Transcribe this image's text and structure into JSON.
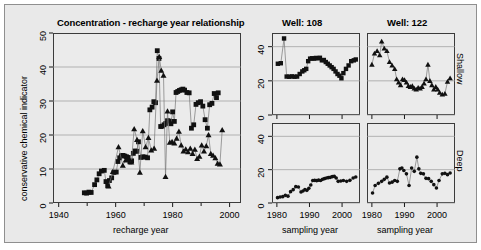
{
  "figure": {
    "background_color": "#e9e9e9",
    "panel_color": "#ebebeb",
    "marker_color": "#111111",
    "line_color": "#777777",
    "grid_color": "#9a9a9a"
  },
  "main_panel": {
    "title": "Concentration - recharge year relationship",
    "xlabel": "recharge year",
    "ylabel": "conservative chemical indicator",
    "xticks": [
      "1940",
      "1960",
      "1980",
      "2000"
    ],
    "yticks": [
      "0",
      "10",
      "20",
      "30",
      "40",
      "50"
    ]
  },
  "column_titles": [
    "Well: 108",
    "Well: 122"
  ],
  "row_titles": [
    "Shallow",
    "Deep"
  ],
  "small_panels": {
    "xlabel": "sampling year",
    "xticks": [
      "1980",
      "1990",
      "2000"
    ],
    "yticks": [
      "0",
      "20",
      "40"
    ]
  },
  "chart_data": [
    {
      "id": "main",
      "type": "scatter",
      "title": "Concentration - recharge year relationship",
      "xlabel": "recharge year",
      "ylabel": "conservative chemical indicator",
      "xlim": [
        1938,
        2004
      ],
      "ylim": [
        0,
        50
      ],
      "xticks": [
        1940,
        1960,
        1980,
        2000
      ],
      "yticks": [
        0,
        10,
        20,
        30,
        40,
        50
      ],
      "grid": true,
      "legend": null,
      "series": [
        {
          "name": "Well: 108",
          "marker": "square",
          "connected": true,
          "x": [
            1949.0,
            1949.8,
            1950.6,
            1951.4,
            1952.6,
            1953.4,
            1954.2,
            1955.0,
            1956.0,
            1956.6,
            1957.2,
            1957.8,
            1958.6,
            1959.4,
            1960.2,
            1960.8,
            1961.4,
            1962.0,
            1962.6,
            1963.2,
            1963.8,
            1964.4,
            1965.0,
            1965.6,
            1966.2,
            1966.8,
            1967.4,
            1968.0,
            1968.8,
            1969.6,
            1970.4,
            1971.2,
            1972.0,
            1972.8,
            1973.4,
            1974.0,
            1974.6,
            1975.2,
            1975.8,
            1976.4,
            1977.0,
            1977.6,
            1978.2,
            1978.8,
            1979.4,
            1980.0,
            1980.6,
            1981.2,
            1981.8,
            1982.4,
            1983.0,
            1983.6,
            1984.2,
            1985.0,
            1985.8,
            1986.6,
            1987.4,
            1988.2,
            1989.0,
            1989.8,
            1990.6,
            1991.4,
            1992.2,
            1993.0,
            1993.8,
            1994.6,
            1995.4,
            1996.0
          ],
          "y": [
            3.0,
            2.9,
            3.2,
            3.1,
            5.4,
            6.8,
            8.6,
            9.4,
            9.6,
            6.3,
            5.1,
            6.6,
            7.4,
            9.0,
            9.1,
            12.2,
            13.3,
            13.9,
            14.0,
            13.8,
            13.6,
            13.4,
            12.1,
            12.4,
            14.6,
            15.3,
            15.2,
            18.0,
            13.4,
            13.6,
            13.5,
            13.3,
            27.4,
            28.2,
            29.8,
            29.5,
            44.8,
            42.5,
            22.5,
            22.6,
            23.0,
            23.4,
            24.2,
            24.1,
            23.3,
            26.8,
            24.0,
            32.5,
            32.8,
            33.1,
            33.3,
            33.5,
            33.2,
            32.5,
            32.4,
            22.0,
            23.0,
            29.0,
            29.5,
            29.8,
            28.5,
            24.5,
            22.0,
            28.9,
            29.3,
            32.2,
            31.0,
            32.4
          ]
        },
        {
          "name": "Well: 122",
          "marker": "triangle",
          "connected": true,
          "x": [
            1957.5,
            1959.0,
            1961.0,
            1962.5,
            1963.5,
            1964.5,
            1965.5,
            1966.5,
            1967.5,
            1968.5,
            1969.5,
            1970.5,
            1971.5,
            1972.5,
            1973.5,
            1974.5,
            1975.3,
            1976.0,
            1976.8,
            1977.5,
            1978.2,
            1979.0,
            1979.8,
            1980.6,
            1981.4,
            1982.2,
            1983.0,
            1983.8,
            1984.6,
            1985.4,
            1986.2,
            1987.0,
            1987.8,
            1988.6,
            1989.4,
            1990.2,
            1991.0,
            1991.8,
            1992.6,
            1993.4,
            1994.2,
            1995.0,
            1995.8,
            1996.6,
            1997.4
          ],
          "y": [
            4.9,
            9.2,
            16.5,
            11.0,
            12.6,
            13.0,
            12.0,
            21.8,
            18.6,
            9.0,
            21.2,
            16.5,
            19.2,
            15.5,
            16.0,
            36.0,
            43.0,
            39.0,
            37.5,
            7.7,
            27.0,
            17.8,
            18.0,
            17.6,
            19.0,
            21.0,
            17.0,
            15.2,
            15.8,
            15.0,
            16.0,
            14.5,
            15.7,
            13.0,
            13.7,
            17.0,
            15.2,
            16.8,
            20.0,
            14.5,
            14.0,
            13.2,
            11.6,
            11.4,
            21.5
          ]
        }
      ]
    },
    {
      "id": "well108-shallow",
      "type": "scatter",
      "title": "Well: 108",
      "row": "Shallow",
      "xlabel": "sampling year",
      "ylabel": "",
      "xlim": [
        1978.5,
        2005.5
      ],
      "ylim": [
        0,
        48
      ],
      "xticks": [
        1980,
        1990,
        2000
      ],
      "yticks": [
        0,
        20,
        40
      ],
      "grid": true,
      "marker": "square",
      "connected": true,
      "x": [
        1980.3,
        1981.2,
        1982.2,
        1983.0,
        1983.8,
        1984.6,
        1985.4,
        1986.2,
        1987.0,
        1987.8,
        1988.4,
        1989.0,
        1989.6,
        1990.2,
        1990.8,
        1991.4,
        1992.0,
        1992.6,
        1993.2,
        1993.8,
        1994.4,
        1995.0,
        1995.6,
        1996.2,
        1996.8,
        1997.4,
        1998.0,
        1998.6,
        1999.2,
        1999.8,
        2000.4,
        2001.2,
        2002.0,
        2002.8,
        2003.6,
        2004.2
      ],
      "y": [
        30.0,
        30.3,
        44.8,
        22.5,
        22.4,
        22.6,
        22.4,
        22.5,
        24.0,
        25.5,
        26.2,
        27.0,
        31.5,
        33.0,
        33.2,
        33.0,
        33.4,
        33.2,
        33.5,
        32.0,
        32.2,
        31.0,
        30.0,
        29.0,
        28.0,
        27.0,
        25.5,
        24.0,
        23.0,
        21.5,
        24.5,
        27.0,
        29.0,
        31.5,
        32.0,
        32.5
      ]
    },
    {
      "id": "well122-shallow",
      "type": "scatter",
      "title": "Well: 122",
      "row": "Shallow",
      "xlabel": "sampling year",
      "ylabel": "",
      "xlim": [
        1978.5,
        2005.5
      ],
      "ylim": [
        0,
        48
      ],
      "xticks": [
        1980,
        1990,
        2000
      ],
      "yticks": [
        0,
        20,
        40
      ],
      "grid": true,
      "marker": "triangle",
      "connected": true,
      "x": [
        1980.0,
        1980.8,
        1981.6,
        1982.4,
        1983.0,
        1983.8,
        1984.6,
        1985.4,
        1986.2,
        1987.0,
        1987.6,
        1988.2,
        1988.8,
        1989.4,
        1990.0,
        1990.6,
        1991.2,
        1991.8,
        1992.4,
        1993.0,
        1993.6,
        1994.2,
        1994.8,
        1995.4,
        1996.0,
        1996.6,
        1997.2,
        1997.8,
        1998.4,
        1999.0,
        1999.6,
        2000.2,
        2000.8,
        2001.6,
        2002.4,
        2003.2,
        2004.0
      ],
      "y": [
        29.5,
        36.0,
        37.5,
        35.0,
        43.0,
        39.0,
        37.5,
        31.0,
        29.0,
        27.0,
        21.0,
        19.0,
        17.5,
        21.0,
        20.5,
        19.0,
        17.0,
        16.5,
        17.0,
        15.5,
        15.0,
        16.0,
        15.5,
        16.5,
        18.5,
        21.0,
        29.5,
        20.0,
        17.5,
        15.0,
        16.5,
        15.0,
        13.0,
        12.0,
        12.5,
        19.5,
        21.5
      ]
    },
    {
      "id": "well108-deep",
      "type": "scatter",
      "title": "Well: 108",
      "row": "Deep",
      "xlabel": "sampling year",
      "ylabel": "",
      "xlim": [
        1978.5,
        2005.5
      ],
      "ylim": [
        0,
        48
      ],
      "xticks": [
        1980,
        1990,
        2000
      ],
      "yticks": [
        0,
        20,
        40
      ],
      "grid": true,
      "marker": "circle",
      "connected": true,
      "x": [
        1980.2,
        1981.0,
        1981.8,
        1982.6,
        1983.4,
        1984.2,
        1985.0,
        1985.8,
        1986.6,
        1987.4,
        1988.0,
        1988.6,
        1989.2,
        1989.8,
        1990.4,
        1991.0,
        1991.6,
        1992.2,
        1992.8,
        1993.4,
        1994.0,
        1994.6,
        1995.2,
        1995.8,
        1996.4,
        1997.0,
        1997.6,
        1998.2,
        1998.8,
        1999.6,
        2000.4,
        2001.4,
        2002.4,
        2003.4,
        2004.2
      ],
      "y": [
        3.2,
        3.6,
        3.8,
        4.6,
        4.1,
        6.8,
        8.0,
        9.8,
        9.6,
        6.6,
        7.2,
        8.0,
        7.6,
        8.8,
        10.8,
        13.5,
        13.6,
        13.4,
        13.7,
        13.5,
        14.2,
        14.6,
        15.0,
        15.2,
        15.4,
        15.8,
        16.0,
        15.0,
        13.0,
        13.2,
        13.5,
        13.0,
        13.6,
        15.0,
        15.6
      ]
    },
    {
      "id": "well122-deep",
      "type": "scatter",
      "title": "Well: 122",
      "row": "Deep",
      "xlabel": "sampling year",
      "ylabel": "",
      "xlim": [
        1978.5,
        2005.5
      ],
      "ylim": [
        0,
        48
      ],
      "xticks": [
        1980,
        1990,
        2000
      ],
      "yticks": [
        0,
        20,
        40
      ],
      "grid": true,
      "marker": "circle",
      "connected": true,
      "x": [
        1980.2,
        1981.0,
        1982.0,
        1983.0,
        1983.8,
        1984.6,
        1985.4,
        1986.2,
        1987.0,
        1987.8,
        1988.6,
        1989.2,
        1989.8,
        1990.6,
        1991.4,
        1992.2,
        1993.0,
        1993.8,
        1994.4,
        1995.0,
        1995.8,
        1996.6,
        1997.4,
        1998.2,
        1999.0,
        1999.8,
        2000.6,
        2001.6,
        2002.4,
        2003.2,
        2004.0
      ],
      "y": [
        6.0,
        10.5,
        11.8,
        13.0,
        14.2,
        15.5,
        12.0,
        12.5,
        13.5,
        13.0,
        20.5,
        21.0,
        19.5,
        17.5,
        10.5,
        21.0,
        19.0,
        27.5,
        20.5,
        17.8,
        17.5,
        14.8,
        14.6,
        13.0,
        11.0,
        9.0,
        13.5,
        17.5,
        17.8,
        17.0,
        18.0
      ]
    }
  ]
}
